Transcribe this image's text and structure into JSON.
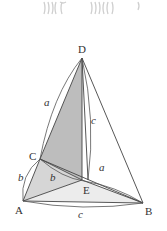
{
  "diagram": {
    "type": "3d-geometry-pyramid",
    "vertices": [
      {
        "id": "D",
        "label": "D",
        "x": 82,
        "y": 58
      },
      {
        "id": "A",
        "label": "A",
        "x": 23,
        "y": 201
      },
      {
        "id": "B",
        "label": "B",
        "x": 143,
        "y": 203
      },
      {
        "id": "C",
        "label": "C",
        "x": 40,
        "y": 159
      },
      {
        "id": "E",
        "label": "E",
        "x": 82,
        "y": 180
      }
    ],
    "edge_labels": {
      "DC": "a",
      "DE": "c",
      "CA": "b",
      "CE": "b",
      "EB": "a",
      "AB": "c"
    },
    "colors": {
      "shaded_dark": "#bdbdbd",
      "shaded_light": "#dcdcdc",
      "shaded_pale": "#ececec",
      "line": "#444444",
      "decoration": "#cfcfcf"
    }
  }
}
